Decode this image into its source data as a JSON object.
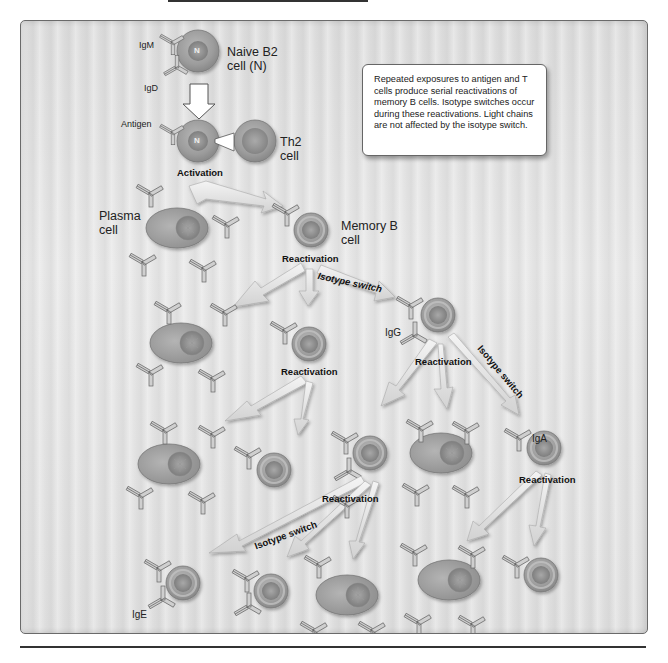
{
  "figure": {
    "note_text": "Repeated exposures to antigen and T cells produce serial reactivations of memory B cells. Isotype switches occur during these reactivations. Light chains are not affected by the isotype switch.",
    "labels": {
      "igm": "IgM",
      "igd": "IgD",
      "naive_cell_line1": "Naive B2",
      "naive_cell_line2": "cell (N)",
      "naive_nucleus": "N",
      "antigen": "Antigen",
      "activated_nucleus": "N",
      "th2_line1": "Th2",
      "th2_line2": "cell",
      "activation": "Activation",
      "plasma_line1": "Plasma",
      "plasma_line2": "cell",
      "memory_line1": "Memory B",
      "memory_line2": "cell",
      "reactivation_1": "Reactivation",
      "isotype_switch_1": "Isotype switch",
      "igg": "IgG",
      "reactivation_2": "Reactivation",
      "reactivation_3": "Reactivation",
      "isotype_switch_2": "Isotype switch",
      "iga": "IgA",
      "reactivation_4": "Reactivation",
      "isotype_switch_3": "Isotype switch",
      "reactivation_5": "Reactivation",
      "ige": "IgE"
    },
    "colors": {
      "cell_fill": "#9a9a9a",
      "cell_rim": "#c4c4c4",
      "nucleus": "#7e7e7e",
      "arrow_fill": "#e8e8e8",
      "background": "#e0e0e0",
      "text": "#222222"
    }
  }
}
